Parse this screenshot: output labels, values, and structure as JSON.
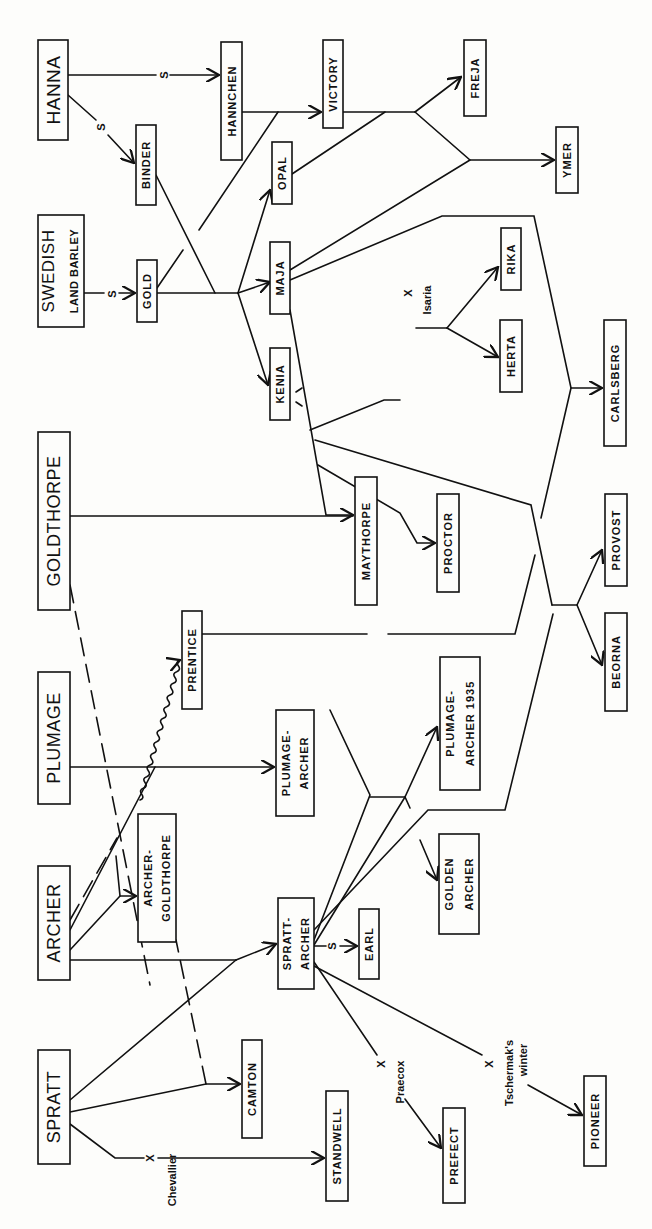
{
  "colors": {
    "ink": "#111111",
    "paper": "#fdfdfb"
  },
  "nodes": [
    {
      "id": "hanna",
      "label": "HANNA",
      "line2": "",
      "x": 38,
      "y": 40,
      "w": 30,
      "h": 100,
      "size": 19,
      "big": true
    },
    {
      "id": "swedish",
      "label": "SWEDISH",
      "line2": "LAND BARLEY",
      "x": 38,
      "y": 215,
      "w": 46,
      "h": 112,
      "size": 17,
      "big": true
    },
    {
      "id": "goldthorpe",
      "label": "GOLDTHORPE",
      "line2": "",
      "x": 38,
      "y": 432,
      "w": 32,
      "h": 178,
      "size": 18,
      "big": true
    },
    {
      "id": "plumage",
      "label": "PLUMAGE",
      "line2": "",
      "x": 38,
      "y": 672,
      "w": 32,
      "h": 132,
      "size": 18,
      "big": true
    },
    {
      "id": "archer",
      "label": "ARCHER",
      "line2": "",
      "x": 38,
      "y": 866,
      "w": 32,
      "h": 114,
      "size": 18,
      "big": true
    },
    {
      "id": "spratt",
      "label": "SPRATT",
      "line2": "",
      "x": 38,
      "y": 1050,
      "w": 32,
      "h": 114,
      "size": 18,
      "big": true
    },
    {
      "id": "binder",
      "label": "BINDER",
      "line2": "",
      "x": 136,
      "y": 125,
      "w": 20,
      "h": 80,
      "size": 11,
      "big": false
    },
    {
      "id": "hannchen",
      "label": "HANNCHEN",
      "line2": "",
      "x": 221,
      "y": 42,
      "w": 21,
      "h": 118,
      "size": 11,
      "big": false
    },
    {
      "id": "victory",
      "label": "VICTORY",
      "line2": "",
      "x": 323,
      "y": 40,
      "w": 20,
      "h": 88,
      "size": 11,
      "big": false
    },
    {
      "id": "freja",
      "label": "FREJA",
      "line2": "",
      "x": 464,
      "y": 40,
      "w": 22,
      "h": 76,
      "size": 11,
      "big": false
    },
    {
      "id": "ymer",
      "label": "YMER",
      "line2": "",
      "x": 556,
      "y": 127,
      "w": 22,
      "h": 66,
      "size": 11,
      "big": false
    },
    {
      "id": "gold",
      "label": "GOLD",
      "line2": "",
      "x": 137,
      "y": 260,
      "w": 20,
      "h": 62,
      "size": 11,
      "big": false
    },
    {
      "id": "opal",
      "label": "OPAL",
      "line2": "",
      "x": 272,
      "y": 142,
      "w": 20,
      "h": 62,
      "size": 11,
      "big": false
    },
    {
      "id": "maja",
      "label": "MAJA",
      "line2": "",
      "x": 270,
      "y": 242,
      "w": 20,
      "h": 72,
      "size": 11,
      "big": false
    },
    {
      "id": "kenia",
      "label": "KENIA",
      "line2": "",
      "x": 270,
      "y": 348,
      "w": 20,
      "h": 72,
      "size": 11,
      "big": false
    },
    {
      "id": "rika",
      "label": "RIKA",
      "line2": "",
      "x": 501,
      "y": 228,
      "w": 20,
      "h": 62,
      "size": 11,
      "big": false
    },
    {
      "id": "herta",
      "label": "HERTA",
      "line2": "",
      "x": 500,
      "y": 320,
      "w": 22,
      "h": 72,
      "size": 11,
      "big": false
    },
    {
      "id": "carlsberg",
      "label": "CARLSBERG",
      "line2": "",
      "x": 604,
      "y": 320,
      "w": 22,
      "h": 126,
      "size": 11,
      "big": false
    },
    {
      "id": "maythorpe",
      "label": "MAYTHORPE",
      "line2": "",
      "x": 355,
      "y": 477,
      "w": 22,
      "h": 128,
      "size": 11,
      "big": false
    },
    {
      "id": "proctor",
      "label": "PROCTOR",
      "line2": "",
      "x": 437,
      "y": 494,
      "w": 22,
      "h": 98,
      "size": 11,
      "big": false
    },
    {
      "id": "provost",
      "label": "PROVOST",
      "line2": "",
      "x": 605,
      "y": 494,
      "w": 22,
      "h": 92,
      "size": 11,
      "big": false
    },
    {
      "id": "beorna",
      "label": "BEORNA",
      "line2": "",
      "x": 605,
      "y": 613,
      "w": 22,
      "h": 98,
      "size": 11,
      "big": false
    },
    {
      "id": "prentice",
      "label": "PRENTICE",
      "line2": "",
      "x": 182,
      "y": 611,
      "w": 20,
      "h": 98,
      "size": 11,
      "big": false
    },
    {
      "id": "plumage_archer",
      "label": "PLUMAGE-",
      "line2": "ARCHER",
      "x": 276,
      "y": 710,
      "w": 38,
      "h": 106,
      "size": 11,
      "big": false
    },
    {
      "id": "plumage_archer_1935",
      "label": "PLUMAGE-",
      "line2": "ARCHER 1935",
      "x": 440,
      "y": 657,
      "w": 40,
      "h": 133,
      "size": 11,
      "big": false
    },
    {
      "id": "golden_archer",
      "label": "GOLDEN",
      "line2": "ARCHER",
      "x": 439,
      "y": 834,
      "w": 40,
      "h": 100,
      "size": 11,
      "big": false
    },
    {
      "id": "archer_goldthorpe",
      "label": "ARCHER-",
      "line2": "GOLDTHORPE",
      "x": 138,
      "y": 814,
      "w": 38,
      "h": 128,
      "size": 11,
      "big": false
    },
    {
      "id": "spratt_archer",
      "label": "SPRATT-",
      "line2": "ARCHER",
      "x": 278,
      "y": 898,
      "w": 36,
      "h": 91,
      "size": 11,
      "big": false
    },
    {
      "id": "earl",
      "label": "EARL",
      "line2": "",
      "x": 359,
      "y": 909,
      "w": 20,
      "h": 70,
      "size": 11,
      "big": false
    },
    {
      "id": "camton",
      "label": "CAMTON",
      "line2": "",
      "x": 242,
      "y": 1040,
      "w": 20,
      "h": 98,
      "size": 11,
      "big": false
    },
    {
      "id": "standwell",
      "label": "STANDWELL",
      "line2": "",
      "x": 326,
      "y": 1091,
      "w": 22,
      "h": 110,
      "size": 11,
      "big": false
    },
    {
      "id": "prefect",
      "label": "PREFECT",
      "line2": "",
      "x": 443,
      "y": 1108,
      "w": 22,
      "h": 95,
      "size": 11,
      "big": false
    },
    {
      "id": "pioneer",
      "label": "PIONEER",
      "line2": "",
      "x": 584,
      "y": 1076,
      "w": 22,
      "h": 90,
      "size": 11,
      "big": false
    }
  ],
  "annotations": [
    {
      "text": "S",
      "x": 164,
      "y": 75,
      "rot": -90
    },
    {
      "text": "S",
      "x": 101,
      "y": 127,
      "rot": -90
    },
    {
      "text": "S",
      "x": 112,
      "y": 294,
      "rot": -90
    },
    {
      "text": "S",
      "x": 332,
      "y": 946,
      "rot": -90
    },
    {
      "text": "X",
      "x": 408,
      "y": 293,
      "rot": -90
    },
    {
      "text": "Isaria",
      "x": 427,
      "y": 300,
      "rot": -90
    },
    {
      "text": "X",
      "x": 150,
      "y": 1158,
      "rot": -90
    },
    {
      "text": "Chevallier",
      "x": 172,
      "y": 1180,
      "rot": -90
    },
    {
      "text": "X",
      "x": 381,
      "y": 1064,
      "rot": -90
    },
    {
      "text": "Praecox",
      "x": 400,
      "y": 1082,
      "rot": -90
    },
    {
      "text": "X",
      "x": 489,
      "y": 1064,
      "rot": -90
    },
    {
      "text": "Tschermak's",
      "x": 509,
      "y": 1073,
      "rot": -90
    },
    {
      "text": "winter",
      "x": 523,
      "y": 1060,
      "rot": -90
    }
  ],
  "edges": [
    {
      "d": "M68,75 L156,75",
      "dash": false
    },
    {
      "d": "M170,75 L219,75",
      "dash": false,
      "arrow": true
    },
    {
      "d": "M68,95 L96,120",
      "dash": false
    },
    {
      "d": "M108,135 L134,163",
      "dash": false,
      "arrow": true
    },
    {
      "d": "M242,112 L321,112",
      "dash": false,
      "arrow": true
    },
    {
      "d": "M84,293 L104,293",
      "dash": false
    },
    {
      "d": "M119,293 L135,293",
      "dash": false,
      "arrow": true
    },
    {
      "d": "M157,293 L238,293",
      "dash": false
    },
    {
      "d": "M156,175 L215,293",
      "dash": false
    },
    {
      "d": "M238,293 L270,282",
      "dash": false,
      "arrow": true
    },
    {
      "d": "M238,293 L270,190",
      "dash": false,
      "arrow": true
    },
    {
      "d": "M238,293 L268,385",
      "dash": false,
      "arrow": true
    },
    {
      "d": "M157,288 L183,250",
      "dash": false
    },
    {
      "d": "M199,230 L278,112",
      "dash": false
    },
    {
      "d": "M343,112 L415,112",
      "dash": false
    },
    {
      "d": "M292,174 L385,112",
      "dash": false
    },
    {
      "d": "M415,112 L461,77",
      "dash": false,
      "arrow": true
    },
    {
      "d": "M415,112 L470,160 L554,160",
      "dash": false,
      "arrow": true
    },
    {
      "d": "M290,270 L470,160",
      "dash": false
    },
    {
      "d": "M290,280 L442,216 L534,216 L571,388 L602,388",
      "dash": false,
      "arrow": true
    },
    {
      "d": "M290,310 L326,515 L353,515",
      "dash": false,
      "arrow": true
    },
    {
      "d": "M310,430 L384,400 L400,400",
      "dash": false
    },
    {
      "d": "M447,328 L498,357",
      "dash": false,
      "arrow": true
    },
    {
      "d": "M447,328 L498,267",
      "dash": false,
      "arrow": true
    },
    {
      "d": "M416,328 L447,328",
      "dash": false
    },
    {
      "d": "M318,465 L400,513 L417,543 L435,543",
      "dash": false,
      "arrow": true
    },
    {
      "d": "M315,440 L531,505 L552,605",
      "dash": false
    },
    {
      "d": "M571,388 L541,518",
      "dash": false
    },
    {
      "d": "M552,605 L577,605 L602,550",
      "dash": false,
      "arrow": true
    },
    {
      "d": "M577,605 L602,665",
      "dash": false,
      "arrow": true
    },
    {
      "d": "M70,516 L353,516",
      "dash": false
    },
    {
      "d": "M70,585 L150,985",
      "dash": true
    },
    {
      "d": "M70,767 L274,767",
      "dash": false,
      "arrow": true
    },
    {
      "d": "M202,634 L367,634",
      "dash": false
    },
    {
      "d": "M388,634 L515,634 L535,555",
      "dash": false
    },
    {
      "d": "M140,800 L180,660",
      "dash": false,
      "wavy": true
    },
    {
      "d": "M70,920 L117,838",
      "dash": true
    },
    {
      "d": "M70,930 L155,767",
      "dash": false
    },
    {
      "d": "M70,950 L120,896 L136,896",
      "dash": false,
      "arrow": true
    },
    {
      "d": "M120,896 L116,856",
      "dash": false
    },
    {
      "d": "M70,960 L236,960",
      "dash": false
    },
    {
      "d": "M236,960 L276,944",
      "dash": false,
      "arrow": true
    },
    {
      "d": "M70,1100 L236,960",
      "dash": false
    },
    {
      "d": "M70,1112 L206,1084 L240,1084",
      "dash": false,
      "arrow": true
    },
    {
      "d": "M206,1084 L176,940",
      "dash": true
    },
    {
      "d": "M70,1124 L115,1158 L144,1158",
      "dash": false
    },
    {
      "d": "M158,1158 L324,1158",
      "dash": false,
      "arrow": true
    },
    {
      "d": "M314,940 L370,795 L330,710",
      "dash": false
    },
    {
      "d": "M314,945 L405,797 L410,808",
      "dash": false
    },
    {
      "d": "M370,797 L405,797 L437,727",
      "dash": false,
      "arrow": true
    },
    {
      "d": "M420,840 L437,880",
      "dash": false,
      "arrow": true
    },
    {
      "d": "M314,930 L428,810 L505,810 L553,614",
      "dash": false
    },
    {
      "d": "M314,946 L326,946",
      "dash": false
    },
    {
      "d": "M340,946 L357,946",
      "dash": false,
      "arrow": true
    },
    {
      "d": "M314,962 L377,1055",
      "dash": false
    },
    {
      "d": "M405,1099 L441,1148",
      "dash": false,
      "arrow": true
    },
    {
      "d": "M314,966 L482,1055",
      "dash": false
    },
    {
      "d": "M528,1085 L582,1115",
      "dash": false,
      "arrow": true
    },
    {
      "d": "M296,392 L302,388",
      "dash": false
    },
    {
      "d": "M296,402 L302,406",
      "dash": false
    }
  ]
}
